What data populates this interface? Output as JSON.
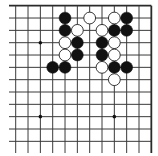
{
  "game": "go",
  "board_view": {
    "columns": 12,
    "rows": 12,
    "edges": [
      "top",
      "right"
    ]
  },
  "star_points": [
    {
      "col": 2,
      "row": 3
    },
    {
      "col": 2,
      "row": 9
    },
    {
      "col": 8,
      "row": 9
    }
  ],
  "stones": [
    {
      "color": "black",
      "col": 4,
      "row": 1
    },
    {
      "color": "white",
      "col": 6,
      "row": 1
    },
    {
      "color": "white",
      "col": 8,
      "row": 1
    },
    {
      "color": "black",
      "col": 9,
      "row": 1
    },
    {
      "color": "black",
      "col": 4,
      "row": 2
    },
    {
      "color": "white",
      "col": 5,
      "row": 2
    },
    {
      "color": "white",
      "col": 7,
      "row": 2
    },
    {
      "color": "black",
      "col": 8,
      "row": 2
    },
    {
      "color": "black",
      "col": 9,
      "row": 2
    },
    {
      "color": "white",
      "col": 4,
      "row": 3
    },
    {
      "color": "black",
      "col": 5,
      "row": 3
    },
    {
      "color": "black",
      "col": 7,
      "row": 3
    },
    {
      "color": "white",
      "col": 8,
      "row": 3
    },
    {
      "color": "white",
      "col": 4,
      "row": 4
    },
    {
      "color": "black",
      "col": 5,
      "row": 4
    },
    {
      "color": "black",
      "col": 7,
      "row": 4
    },
    {
      "color": "white",
      "col": 8,
      "row": 4
    },
    {
      "color": "black",
      "col": 3,
      "row": 5
    },
    {
      "color": "black",
      "col": 4,
      "row": 5
    },
    {
      "color": "white",
      "col": 7,
      "row": 5
    },
    {
      "color": "black",
      "col": 8,
      "row": 5
    },
    {
      "color": "black",
      "col": 9,
      "row": 5
    },
    {
      "color": "white",
      "col": 8,
      "row": 6
    }
  ]
}
